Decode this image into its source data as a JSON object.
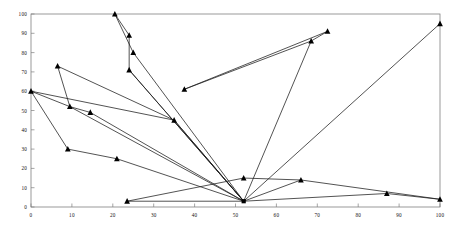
{
  "chart_data": {
    "type": "line",
    "title": "",
    "subtitle": "",
    "xlabel": "",
    "ylabel": "",
    "xlim": [
      0,
      100
    ],
    "ylim": [
      0,
      100
    ],
    "xticks": [
      0,
      10,
      20,
      30,
      40,
      50,
      60,
      70,
      80,
      90,
      100
    ],
    "yticks": [
      0,
      10,
      20,
      30,
      40,
      50,
      60,
      70,
      80,
      90,
      100
    ],
    "xtick_labels": [
      "0",
      "10",
      "20",
      "30",
      "40",
      "50",
      "60",
      "70",
      "80",
      "90",
      "100"
    ],
    "ytick_labels": [
      "0",
      "10",
      "20",
      "30",
      "40",
      "50",
      "60",
      "70",
      "80",
      "90",
      "100"
    ],
    "grid": false,
    "legend": "none",
    "marker": "triangle",
    "line_color": "#1a1a1a",
    "marker_color": "#000000",
    "hub": {
      "x": 52,
      "y": 3,
      "marker": "square",
      "label": "hub-node"
    },
    "series": [
      {
        "name": "path-1",
        "points": [
          {
            "x": 0,
            "y": 60
          },
          {
            "x": 9,
            "y": 30
          },
          {
            "x": 21,
            "y": 25
          },
          {
            "x": 52,
            "y": 3
          }
        ]
      },
      {
        "name": "path-2",
        "points": [
          {
            "x": 0,
            "y": 60
          },
          {
            "x": 9.5,
            "y": 52
          },
          {
            "x": 14.5,
            "y": 49
          },
          {
            "x": 52,
            "y": 3
          }
        ]
      },
      {
        "name": "path-3",
        "points": [
          {
            "x": 0,
            "y": 60
          },
          {
            "x": 35,
            "y": 45
          },
          {
            "x": 52,
            "y": 3
          }
        ]
      },
      {
        "name": "path-4",
        "points": [
          {
            "x": 6.5,
            "y": 73
          },
          {
            "x": 9.5,
            "y": 52
          },
          {
            "x": 52,
            "y": 3
          }
        ]
      },
      {
        "name": "path-5",
        "points": [
          {
            "x": 6.5,
            "y": 73
          },
          {
            "x": 35,
            "y": 45
          },
          {
            "x": 52,
            "y": 3
          }
        ]
      },
      {
        "name": "path-6",
        "points": [
          {
            "x": 20.5,
            "y": 100
          },
          {
            "x": 24,
            "y": 89
          },
          {
            "x": 24,
            "y": 71
          },
          {
            "x": 52,
            "y": 3
          }
        ]
      },
      {
        "name": "path-7",
        "points": [
          {
            "x": 20.5,
            "y": 100
          },
          {
            "x": 25,
            "y": 80
          },
          {
            "x": 52,
            "y": 3
          }
        ]
      },
      {
        "name": "path-8",
        "points": [
          {
            "x": 23.5,
            "y": 3
          },
          {
            "x": 52,
            "y": 3
          }
        ]
      },
      {
        "name": "path-9",
        "points": [
          {
            "x": 23.5,
            "y": 3
          },
          {
            "x": 52,
            "y": 15
          },
          {
            "x": 66,
            "y": 14
          },
          {
            "x": 52,
            "y": 3
          }
        ]
      },
      {
        "name": "path-10",
        "points": [
          {
            "x": 37.5,
            "y": 61
          },
          {
            "x": 68.5,
            "y": 86
          },
          {
            "x": 52,
            "y": 3
          }
        ]
      },
      {
        "name": "path-11",
        "points": [
          {
            "x": 37.5,
            "y": 61
          },
          {
            "x": 72.5,
            "y": 91
          },
          {
            "x": 68.5,
            "y": 86
          }
        ]
      },
      {
        "name": "path-12",
        "points": [
          {
            "x": 52,
            "y": 3
          },
          {
            "x": 87,
            "y": 7
          },
          {
            "x": 100,
            "y": 4
          }
        ]
      },
      {
        "name": "path-13",
        "points": [
          {
            "x": 66,
            "y": 14
          },
          {
            "x": 100,
            "y": 4
          }
        ]
      },
      {
        "name": "path-14",
        "points": [
          {
            "x": 52,
            "y": 3
          },
          {
            "x": 100,
            "y": 95
          }
        ]
      },
      {
        "name": "path-15",
        "points": [
          {
            "x": 24,
            "y": 71
          },
          {
            "x": 52,
            "y": 3
          }
        ]
      }
    ],
    "markers": [
      {
        "x": 0,
        "y": 60
      },
      {
        "x": 6.5,
        "y": 73
      },
      {
        "x": 9,
        "y": 30
      },
      {
        "x": 9.5,
        "y": 52
      },
      {
        "x": 14.5,
        "y": 49
      },
      {
        "x": 20.5,
        "y": 100
      },
      {
        "x": 21,
        "y": 25
      },
      {
        "x": 23.5,
        "y": 3
      },
      {
        "x": 24,
        "y": 89
      },
      {
        "x": 24,
        "y": 71
      },
      {
        "x": 25,
        "y": 80
      },
      {
        "x": 35,
        "y": 45
      },
      {
        "x": 37.5,
        "y": 61
      },
      {
        "x": 52,
        "y": 15
      },
      {
        "x": 66,
        "y": 14
      },
      {
        "x": 68.5,
        "y": 86
      },
      {
        "x": 72.5,
        "y": 91
      },
      {
        "x": 87,
        "y": 7
      },
      {
        "x": 100,
        "y": 4
      },
      {
        "x": 100,
        "y": 95
      }
    ]
  },
  "axes": {
    "frame_color": "#808080",
    "tick_color": "#808080",
    "label_color": "#111111"
  }
}
